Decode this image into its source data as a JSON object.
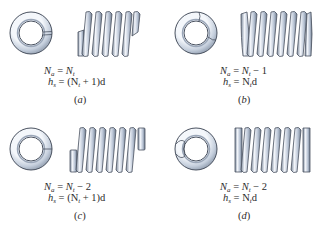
{
  "figure": {
    "colors": {
      "metal_light": "#eef2f8",
      "metal_mid": "#b8c4d6",
      "metal_dark": "#6d7a8c",
      "outline": "#4a5260",
      "text": "#2b2b2b",
      "background": "#ffffff"
    },
    "panels": [
      {
        "id": "a",
        "end_type": "plain ends",
        "caption_letter": "a",
        "eq1": {
          "lhs_var": "N",
          "lhs_sub": "a",
          "rhs": "N",
          "rhs_sub": "t",
          "rhs_tail": ""
        },
        "eq2": {
          "lhs_var": "h",
          "lhs_sub": "s",
          "text": "= (N",
          "sub": "t",
          "tail": " + 1)d"
        }
      },
      {
        "id": "b",
        "end_type": "plain and ground ends",
        "caption_letter": "b",
        "eq1": {
          "lhs_var": "N",
          "lhs_sub": "a",
          "rhs": "N",
          "rhs_sub": "t",
          "rhs_tail": " − 1"
        },
        "eq2": {
          "lhs_var": "h",
          "lhs_sub": "s",
          "text": "= N",
          "sub": "t",
          "tail": "d"
        }
      },
      {
        "id": "c",
        "end_type": "squared (closed) ends",
        "caption_letter": "c",
        "eq1": {
          "lhs_var": "N",
          "lhs_sub": "a",
          "rhs": "N",
          "rhs_sub": "t",
          "rhs_tail": " − 2"
        },
        "eq2": {
          "lhs_var": "h",
          "lhs_sub": "s",
          "text": "= (N",
          "sub": "t",
          "tail": " + 1)d"
        }
      },
      {
        "id": "d",
        "end_type": "squared and ground ends",
        "caption_letter": "d",
        "eq1": {
          "lhs_var": "N",
          "lhs_sub": "a",
          "rhs": "N",
          "rhs_sub": "t",
          "rhs_tail": " − 2"
        },
        "eq2": {
          "lhs_var": "h",
          "lhs_sub": "s",
          "text": "= N",
          "sub": "t",
          "tail": "d"
        }
      }
    ]
  }
}
